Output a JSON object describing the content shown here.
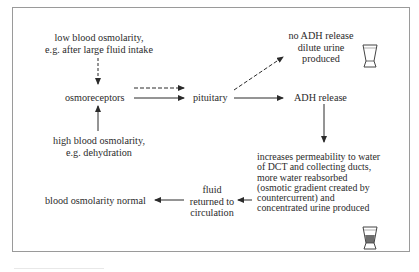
{
  "diagram": {
    "type": "flowchart",
    "title": "",
    "nodes": {
      "low_osmolarity": {
        "line1": "low blood osmolarity,",
        "line2": "e.g. after large fluid intake"
      },
      "osmoreceptors": {
        "label": "osmoreceptors"
      },
      "high_osmolarity": {
        "line1": "high blood osmolarity,",
        "line2": "e.g. dehydration"
      },
      "pituitary": {
        "label": "pituitary"
      },
      "no_adh": {
        "line1": "no ADH release",
        "line2": "dilute urine",
        "line3": "produced"
      },
      "adh_release": {
        "label": "ADH release"
      },
      "permeability": {
        "line1": "increases permeability to water",
        "line2": "of DCT and collecting ducts,",
        "line3": "more water reabsorbed",
        "line4": "(osmotic gradient created by",
        "line5": "countercurrent) and",
        "line6": "concentrated urine produced"
      },
      "fluid_returned": {
        "line1": "fluid",
        "line2": "returned to",
        "line3": "circulation"
      },
      "normal": {
        "label": "blood osmolarity normal"
      }
    },
    "edges": [
      {
        "from": "low_osmolarity",
        "to": "osmoreceptors",
        "style": "dashed"
      },
      {
        "from": "high_osmolarity",
        "to": "osmoreceptors",
        "style": "solid"
      },
      {
        "from": "osmoreceptors",
        "to": "pituitary",
        "style": "dashed"
      },
      {
        "from": "osmoreceptors",
        "to": "pituitary",
        "style": "solid"
      },
      {
        "from": "pituitary",
        "to": "no_adh",
        "style": "dashed"
      },
      {
        "from": "pituitary",
        "to": "adh_release",
        "style": "solid"
      },
      {
        "from": "adh_release",
        "to": "permeability",
        "style": "solid"
      },
      {
        "from": "permeability",
        "to": "fluid_returned",
        "style": "solid"
      },
      {
        "from": "fluid_returned",
        "to": "normal",
        "style": "solid"
      }
    ],
    "icons": {
      "dilute_beaker": "empty-beaker-icon",
      "concentrated_beaker": "dark-filled-beaker-icon"
    },
    "colors": {
      "line": "#2b2b2b",
      "frame": "#9a9a9a",
      "concentrate_fill": "#6e6e6e"
    }
  }
}
